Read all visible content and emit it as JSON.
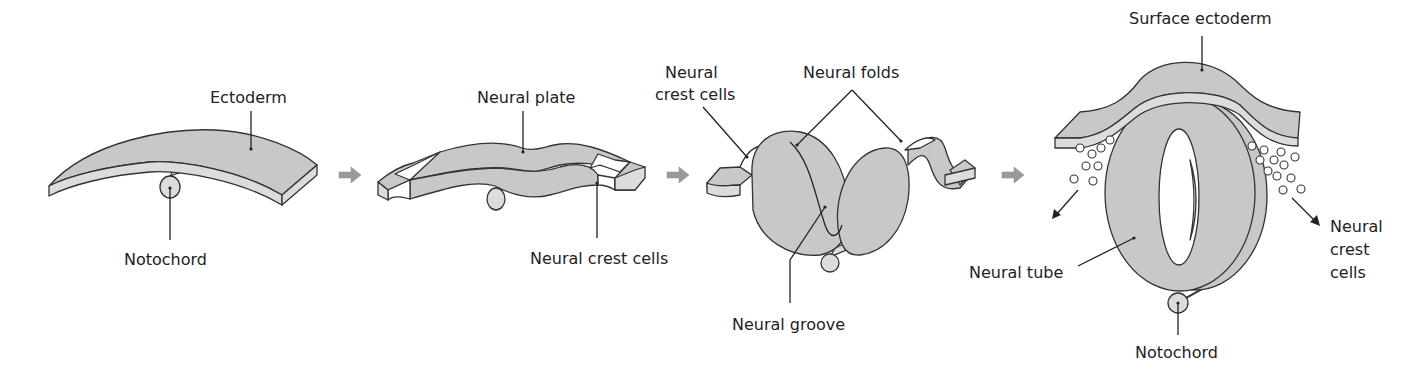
{
  "figure": {
    "colors": {
      "tissue_fill": "#c8c8c8",
      "outline": "#333333",
      "step_arrow": "#9a9a9a",
      "background": "#ffffff"
    }
  },
  "stages": [
    {
      "id": "stage-1",
      "labels": {
        "top": "Ectoderm",
        "bottom": "Notochord"
      }
    },
    {
      "id": "stage-2",
      "labels": {
        "top": "Neural plate",
        "bottom": "Neural crest cells"
      }
    },
    {
      "id": "stage-3",
      "labels": {
        "crest_line1": "Neural",
        "crest_line2": "crest cells",
        "folds": "Neural folds",
        "groove": "Neural groove"
      }
    },
    {
      "id": "stage-4",
      "labels": {
        "top": "Surface ectoderm",
        "tube": "Neural tube",
        "crest_line1": "Neural",
        "crest_line2": "crest",
        "crest_line3": "cells",
        "bottom": "Notochord"
      }
    }
  ],
  "step_arrows": [
    "arrow-1-to-2",
    "arrow-2-to-3",
    "arrow-3-to-4"
  ]
}
